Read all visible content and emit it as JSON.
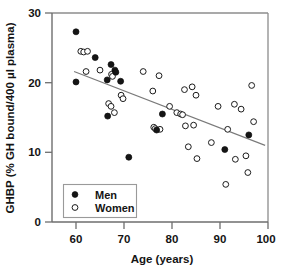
{
  "chart_data": {
    "type": "scatter",
    "title": "",
    "xlabel": "Age (years)",
    "ylabel": "GHBP (% GH bound/400 µl plasma)",
    "xlim": [
      55,
      100
    ],
    "ylim": [
      0,
      30
    ],
    "xticks": [
      60,
      70,
      80,
      90,
      100
    ],
    "yticks": [
      0,
      10,
      20,
      30
    ],
    "xtick_labels": [
      "60",
      "70",
      "80",
      "90",
      "100"
    ],
    "ytick_labels": [
      "0",
      "10",
      "20",
      "30"
    ],
    "grid": false,
    "legend_position": "lower-left-inside",
    "legend_entries": [
      {
        "label": "Men",
        "marker": "filled-circle",
        "color": "#151515"
      },
      {
        "label": "Women",
        "marker": "open-circle",
        "color": "#ffffff"
      }
    ],
    "series": [
      {
        "name": "Men",
        "marker": "filled-circle",
        "points": [
          [
            60.0,
            27.3
          ],
          [
            60.0,
            20.1
          ],
          [
            64.0,
            23.6
          ],
          [
            66.5,
            20.4
          ],
          [
            66.6,
            15.2
          ],
          [
            67.3,
            22.6
          ],
          [
            68.1,
            21.8
          ],
          [
            68.3,
            21.5
          ],
          [
            69.3,
            20.2
          ],
          [
            71.0,
            9.3
          ],
          [
            76.8,
            13.2
          ],
          [
            78.0,
            15.5
          ],
          [
            91.0,
            10.4
          ],
          [
            96.0,
            12.5
          ]
        ]
      },
      {
        "name": "Women",
        "marker": "open-circle",
        "points": [
          [
            61.0,
            24.5
          ],
          [
            61.6,
            24.4
          ],
          [
            62.4,
            24.5
          ],
          [
            62.1,
            21.6
          ],
          [
            65.0,
            21.8
          ],
          [
            67.4,
            21.2
          ],
          [
            67.6,
            20.9
          ],
          [
            66.8,
            17.0
          ],
          [
            67.3,
            16.6
          ],
          [
            68.0,
            15.7
          ],
          [
            69.4,
            18.2
          ],
          [
            69.8,
            17.7
          ],
          [
            74.0,
            21.6
          ],
          [
            76.0,
            18.8
          ],
          [
            76.2,
            13.6
          ],
          [
            76.5,
            13.4
          ],
          [
            77.3,
            21.0
          ],
          [
            77.5,
            13.3
          ],
          [
            79.5,
            16.6
          ],
          [
            81.0,
            15.7
          ],
          [
            81.8,
            15.5
          ],
          [
            82.2,
            15.4
          ],
          [
            82.6,
            19.0
          ],
          [
            82.8,
            13.8
          ],
          [
            83.4,
            10.8
          ],
          [
            84.2,
            19.4
          ],
          [
            84.5,
            13.9
          ],
          [
            85.0,
            18.2
          ],
          [
            85.2,
            9.1
          ],
          [
            88.2,
            11.4
          ],
          [
            89.6,
            16.6
          ],
          [
            91.2,
            5.4
          ],
          [
            91.6,
            13.3
          ],
          [
            93.0,
            16.9
          ],
          [
            93.2,
            9.0
          ],
          [
            94.4,
            16.2
          ],
          [
            95.4,
            9.5
          ],
          [
            95.8,
            7.1
          ],
          [
            96.6,
            19.6
          ],
          [
            97.0,
            14.4
          ]
        ]
      }
    ],
    "trendline": {
      "label": "regression-line",
      "x_start": 59.6,
      "y_start": 21.6,
      "x_end": 99.4,
      "y_end": 11.0
    }
  }
}
